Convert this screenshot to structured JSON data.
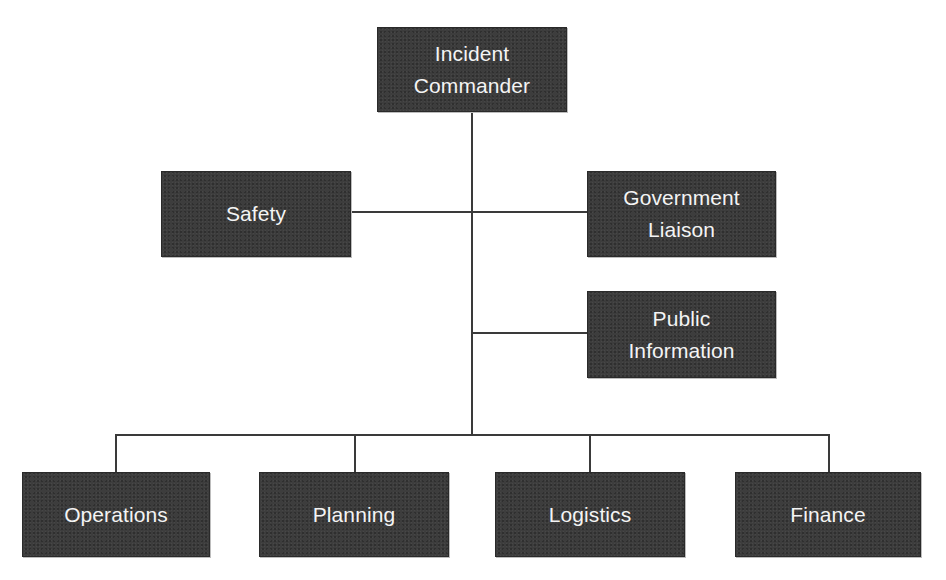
{
  "diagram": {
    "type": "organization-chart",
    "colors": {
      "box_fill": "#3d3d3d",
      "box_text": "#f4f4f4",
      "connector": "#3a3a3a",
      "background": "#ffffff"
    },
    "root": {
      "label": "Incident\nCommander"
    },
    "command_staff": [
      {
        "label": "Safety",
        "side": "left"
      },
      {
        "label": "Government\nLiaison",
        "side": "right"
      },
      {
        "label": "Public\nInformation",
        "side": "right"
      }
    ],
    "general_staff": [
      {
        "label": "Operations"
      },
      {
        "label": "Planning"
      },
      {
        "label": "Logistics"
      },
      {
        "label": "Finance"
      }
    ],
    "edges": [
      {
        "from": "Incident Commander",
        "to": "Safety"
      },
      {
        "from": "Incident Commander",
        "to": "Government Liaison"
      },
      {
        "from": "Incident Commander",
        "to": "Public Information"
      },
      {
        "from": "Incident Commander",
        "to": "Operations"
      },
      {
        "from": "Incident Commander",
        "to": "Planning"
      },
      {
        "from": "Incident Commander",
        "to": "Logistics"
      },
      {
        "from": "Incident Commander",
        "to": "Finance"
      }
    ]
  }
}
